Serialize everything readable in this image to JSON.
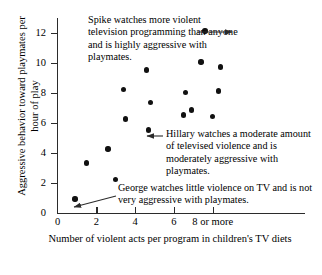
{
  "chart_data": {
    "type": "scatter",
    "title": "",
    "xlabel": "Number of violent acts per program in children's TV diets",
    "ylabel": "Aggressive behavior toward playmates per hour of play",
    "xlim": [
      0,
      9
    ],
    "ylim": [
      0,
      13
    ],
    "grid": false,
    "legend": "none",
    "x_ticks": [
      "0",
      "2",
      "4",
      "6",
      "8 or more"
    ],
    "x_tick_values": [
      0,
      2,
      4,
      6,
      8
    ],
    "y_ticks": [
      "0",
      "2",
      "4",
      "6",
      "8",
      "10",
      "12"
    ],
    "y_tick_values": [
      0,
      2,
      4,
      6,
      8,
      10,
      12
    ],
    "points": [
      {
        "x": 0.9,
        "y": 0.9,
        "label": "George"
      },
      {
        "x": 1.5,
        "y": 3.3,
        "label": ""
      },
      {
        "x": 2.6,
        "y": 4.25,
        "label": ""
      },
      {
        "x": 3.0,
        "y": 2.2,
        "label": ""
      },
      {
        "x": 3.4,
        "y": 8.2,
        "label": ""
      },
      {
        "x": 3.5,
        "y": 6.25,
        "label": ""
      },
      {
        "x": 4.6,
        "y": 9.5,
        "label": ""
      },
      {
        "x": 4.7,
        "y": 5.5,
        "label": "Hillary"
      },
      {
        "x": 4.8,
        "y": 7.35,
        "label": ""
      },
      {
        "x": 6.5,
        "y": 6.5,
        "label": ""
      },
      {
        "x": 6.6,
        "y": 8.0,
        "label": ""
      },
      {
        "x": 6.9,
        "y": 6.85,
        "label": ""
      },
      {
        "x": 7.4,
        "y": 10.05,
        "label": ""
      },
      {
        "x": 7.6,
        "y": 12.1,
        "label": "Spike"
      },
      {
        "x": 8.0,
        "y": 6.4,
        "label": ""
      },
      {
        "x": 8.3,
        "y": 8.1,
        "label": ""
      },
      {
        "x": 8.4,
        "y": 9.7,
        "label": ""
      }
    ],
    "annotations": [
      {
        "name": "spike",
        "text": "Spike watches more violent television programming than anyone and is highly aggressive with playmates.",
        "target": {
          "x": 7.6,
          "y": 12.1
        }
      },
      {
        "name": "hillary",
        "text": "Hillary watches a moderate amount of televised violence and is moderately aggressive with playmates.",
        "target": {
          "x": 4.7,
          "y": 5.5
        }
      },
      {
        "name": "george",
        "text": "George watches little violence on TV and is not very aggressive with playmates.",
        "target": {
          "x": 0.9,
          "y": 0.9
        }
      }
    ],
    "colors": {
      "point": "#111111",
      "axis": "#2b2b2b",
      "text": "#000000",
      "background": "#ffffff"
    }
  }
}
